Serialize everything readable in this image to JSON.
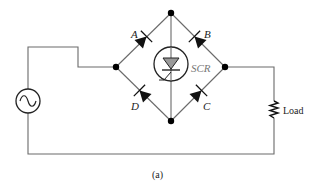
{
  "figure": {
    "caption": "(a)",
    "colors": {
      "wire": "#6a6a6a",
      "ink": "#111111",
      "scr_fill": "#9a9a9a",
      "scr_label": "#777777"
    }
  },
  "components": {
    "source": {
      "label": "",
      "icon": "ac-source-icon"
    },
    "diodes": [
      {
        "id": "A",
        "label": "A"
      },
      {
        "id": "B",
        "label": "B"
      },
      {
        "id": "C",
        "label": "C"
      },
      {
        "id": "D",
        "label": "D"
      }
    ],
    "scr": {
      "label": "SCR"
    },
    "load": {
      "label": "Load"
    }
  }
}
